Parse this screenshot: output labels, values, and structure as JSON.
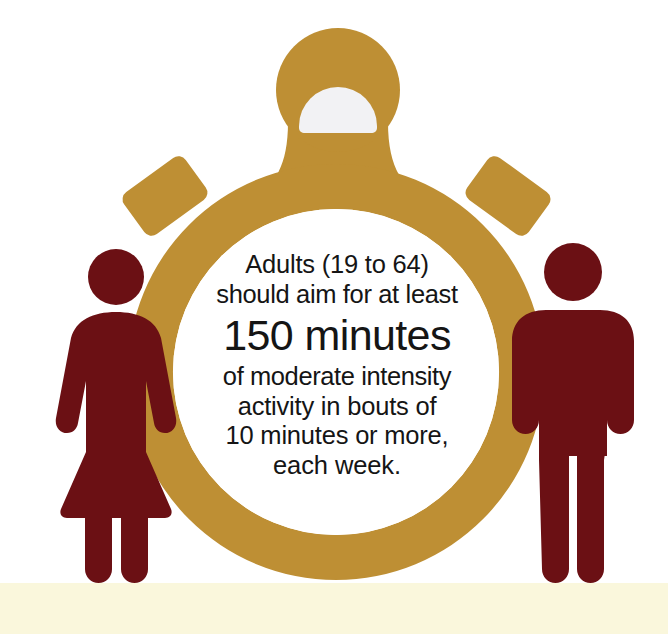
{
  "poster": {
    "title": "Adults physical activity guideline",
    "width": 668,
    "height": 634,
    "background_color": "#FFFFFF",
    "footer_band_color": "#FAF7DC"
  },
  "colors": {
    "gold": "#BE8F34",
    "gold_shade": "#B4862D",
    "maroon": "#6B1014",
    "crown_inner": "#F2F2F4",
    "dial_face": "#FFFFFF",
    "text": "#151515",
    "cream_band": "#FAF7DC"
  },
  "message": {
    "lines": [
      "Adults (19 to 64)",
      "should aim for at least",
      "150 minutes",
      "of moderate intensity",
      "activity in bouts of",
      "10 minutes or more,",
      "each week."
    ],
    "emphasis_line": "150 minutes",
    "full_text": "Adults (19 to 64) should aim for at least 150 minutes of moderate intensity activity in bouts of 10 minutes or more, each week.",
    "age_range": "19 to 64",
    "duration_minutes": 150,
    "bout_minutes": 10,
    "period": "each week",
    "intensity": "moderate"
  },
  "graphics": {
    "stopwatch": {
      "label": "stopwatch",
      "color": "#BE8F34",
      "ring_center_x": 336,
      "ring_center_y": 372,
      "ring_outer_radius": 208,
      "ring_inner_radius": 163,
      "crown_center_x": 338,
      "crown_center_y": 90,
      "crown_outer_radius": 62,
      "crown_inner_radius": 39,
      "crown_inner_color": "#F2F2F4",
      "buttons": [
        {
          "name": "left-button",
          "x": 165,
          "y": 196,
          "rotation_deg": -36
        },
        {
          "name": "right-button",
          "x": 508,
          "y": 196,
          "rotation_deg": 36
        }
      ]
    },
    "figures": [
      {
        "name": "female-pictogram",
        "color": "#6B1014",
        "side": "left"
      },
      {
        "name": "male-pictogram",
        "color": "#6B1014",
        "side": "right"
      }
    ]
  }
}
